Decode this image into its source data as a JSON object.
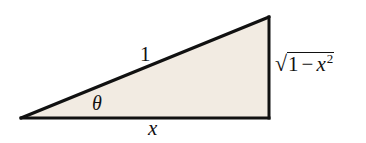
{
  "figure": {
    "type": "right-triangle",
    "fill_color": "#f2ebe2",
    "stroke_color": "#111111",
    "vertices": {
      "left": [
        21,
        118
      ],
      "bottom_right": [
        269,
        118
      ],
      "top_right": [
        269,
        17
      ]
    },
    "labels": {
      "hypotenuse": "1",
      "angle": "θ",
      "adjacent": "x",
      "opposite": {
        "sqrt_symbol": "√",
        "constant": "1",
        "minus": "−",
        "variable": "x",
        "exponent": "2"
      }
    }
  }
}
